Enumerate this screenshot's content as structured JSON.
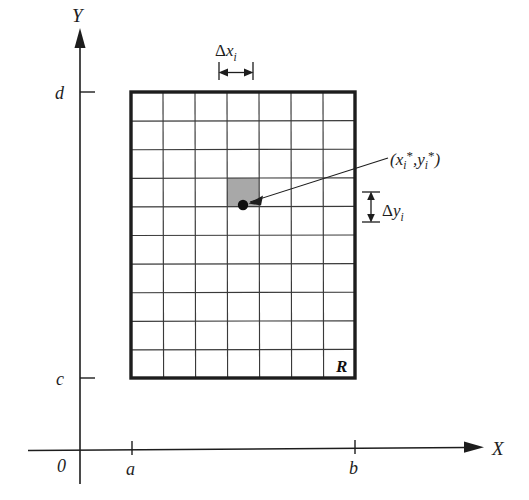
{
  "figure": {
    "background_color": "#ffffff",
    "ink_color": "#1d1d1d"
  },
  "axes": {
    "x_axis_label": "X",
    "y_axis_label": "Y",
    "origin_label": "0",
    "x_ticks": [
      {
        "label": "a",
        "x": 132
      },
      {
        "label": "b",
        "x": 355
      }
    ],
    "y_ticks": [
      {
        "label": "d",
        "y": 92
      },
      {
        "label": "c",
        "y": 378
      }
    ]
  },
  "region": {
    "label": "R",
    "border_color": "#1d1d1d",
    "grid_color": "#3a3a3a",
    "columns": 7,
    "rows": 10,
    "left": 131,
    "right": 355,
    "top": 92,
    "bottom": 378
  },
  "sample_cell": {
    "fill_color": "#a8a8a8",
    "column_index": 3,
    "row_index": 3,
    "point_color": "#101010",
    "point_label_parts": {
      "open_paren": "(",
      "x_base": "x",
      "x_sub": "i",
      "x_star": "*",
      "comma": ",",
      "y_base": "y",
      "y_sub": "i",
      "y_star": "*",
      "close_paren": ")"
    },
    "point_label_text": "(xi*,yi*)"
  },
  "annotations": {
    "delta_x": {
      "symbol": "Δ",
      "base": "x",
      "subscript": "i",
      "text": "Δxi"
    },
    "delta_y": {
      "symbol": "Δ",
      "base": "y",
      "subscript": "i",
      "text": "Δyi"
    }
  }
}
